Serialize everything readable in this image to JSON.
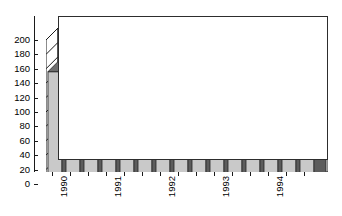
{
  "chart_data": {
    "type": "bar",
    "title": "",
    "subtitle": "",
    "xlabel": "",
    "ylabel": "",
    "ylim": [
      0,
      200
    ],
    "ytick_step": 20,
    "yticks": [
      0,
      20,
      40,
      60,
      80,
      100,
      120,
      140,
      160,
      180,
      200
    ],
    "ytick_labels": [
      "0",
      "20",
      "40",
      "60",
      "80",
      "100",
      "120",
      "140",
      "160",
      "180",
      "200"
    ],
    "grid": true,
    "grid_axis": "y",
    "legend": false,
    "legend_position": "none",
    "style": "3d-column",
    "categories": [
      "1990 Q1",
      "1990 Q2",
      "1990 Q3",
      "1991 Q1",
      "1991 Q2",
      "1991 Q3",
      "1992 Q1",
      "1992 Q2",
      "1992 Q3",
      "1993 Q1",
      "1993 Q2",
      "1993 Q3",
      "1994 Q1",
      "1994 Q2",
      "1994 Q3"
    ],
    "values": [
      156,
      158,
      168,
      176,
      196,
      158,
      146,
      140,
      130,
      118,
      100,
      98,
      84,
      78,
      62
    ],
    "axis_group_labels": [
      "1990",
      "1991",
      "1992",
      "1993",
      "1994"
    ],
    "axis_group_positions": [
      1,
      4,
      7,
      10,
      13
    ],
    "bars_per_group": 3,
    "colors": {
      "bar_face": "#c9c9c9",
      "bar_side": "#5c5c5c",
      "bar_top": "#6e6e6e",
      "bar_outline": "#2b2b2b",
      "grid": "#3a3a3a",
      "axis": "#1a1a1a",
      "background": "#ffffff",
      "wall": "#ffffff",
      "floor": "#d8d8d8",
      "text": "#000000"
    }
  }
}
